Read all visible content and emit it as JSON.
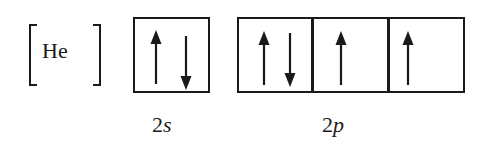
{
  "diagram": {
    "core": {
      "label": "He"
    },
    "subshells": [
      {
        "name": "2s",
        "number": "2",
        "letter": "s",
        "orbitals": [
          {
            "electrons": [
              "up",
              "down"
            ]
          }
        ]
      },
      {
        "name": "2p",
        "number": "2",
        "letter": "p",
        "orbitals": [
          {
            "electrons": [
              "up",
              "down"
            ]
          },
          {
            "electrons": [
              "up"
            ]
          },
          {
            "electrons": [
              "up"
            ]
          }
        ]
      }
    ],
    "colors": {
      "ink": "#1a1a1a",
      "background": "#ffffff"
    }
  }
}
